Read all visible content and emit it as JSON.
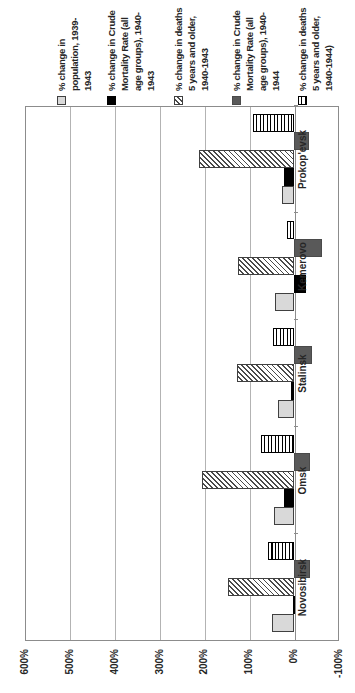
{
  "chart_data": {
    "type": "bar",
    "title": "",
    "xlabel": "",
    "ylabel": "",
    "presentation": "column chart rotated 90 degrees counterclockwise on the page",
    "categories": [
      "Novosibirsk",
      "Omsk",
      "Stalinsk",
      "Kemerovo",
      "Prokop'evsk"
    ],
    "series": [
      {
        "name": "% change in population, 1939-1943",
        "legend_label": "% change in\npopulation, 1939-\n1943",
        "style": "solid-light-gray",
        "color": "#d9d9d9",
        "values": [
          50,
          45,
          35,
          43,
          27
        ]
      },
      {
        "name": "% change in Crude Mortality Rate (all age groups), 1940-1943",
        "legend_label": "% change in Crude\nMortality Rate (all\nage groups), 1940-\n1943",
        "style": "solid-black",
        "color": "#000000",
        "values": [
          2,
          23,
          7,
          -26,
          22
        ]
      },
      {
        "name": "% change in deaths 5 years and older, 1940-1943",
        "legend_label": "% change in deaths\n5 years and older,\n1940-1943",
        "style": "diagonal-hatch",
        "color": "#ffffff",
        "values": [
          148,
          205,
          127,
          125,
          212
        ]
      },
      {
        "name": "% change in Crude Mortality Rate (all age groups), 1940-1944",
        "legend_label": "% change in Crude\nMortality Rate (all\nage groups), 1940-\n1944",
        "style": "solid-dark-gray",
        "color": "#595959",
        "values": [
          -35,
          -35,
          -40,
          -63,
          -34
        ]
      },
      {
        "name": "% change in deaths 5 years and older, 1940-1944)",
        "legend_label": "% change in deaths\n5 years and older,\n1940-1944)",
        "style": "horizontal-line-pattern",
        "color": "#ffffff",
        "values": [
          58,
          73,
          48,
          17,
          91
        ]
      }
    ],
    "ylim": [
      -100,
      600
    ],
    "ytick_values": [
      600,
      500,
      400,
      300,
      200,
      100,
      0,
      -100
    ],
    "ytick_labels": [
      "600%",
      "500%",
      "400%",
      "300%",
      "200%",
      "100%",
      "0%",
      "-100%"
    ],
    "grid": true,
    "legend_position": "right of plot in native orientation (top edge of rotated page)"
  },
  "colors": {
    "background": "#ffffff",
    "gridline": "#b3b3b3",
    "plot_border": "#8c8c8c",
    "text": "#262626",
    "bar_light_gray": "#d9d9d9",
    "bar_black": "#000000",
    "bar_dark_gray": "#595959"
  }
}
